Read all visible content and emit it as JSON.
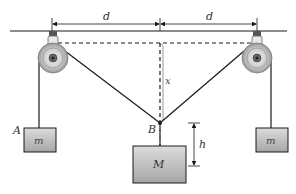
{
  "diagram": {
    "labels": {
      "d_left": "d",
      "d_right": "d",
      "x": "x",
      "B": "B",
      "h": "h",
      "A": "A",
      "mass_left": "m",
      "mass_right": "m",
      "mass_center": "M"
    },
    "colors": {
      "line": "#1a1a1a",
      "mass_fill_top": "#d9d9d9",
      "mass_fill_bottom": "#a8a8a8",
      "pulley_outer": "#bdbdbd",
      "pulley_inner": "#888888",
      "background": "#ffffff"
    },
    "components": [
      "ceiling",
      "left-pulley",
      "right-pulley",
      "left-mass-A",
      "right-mass",
      "center-mass-M",
      "point-B",
      "dimension-d-left",
      "dimension-d-right",
      "dimension-x",
      "dimension-h"
    ]
  }
}
